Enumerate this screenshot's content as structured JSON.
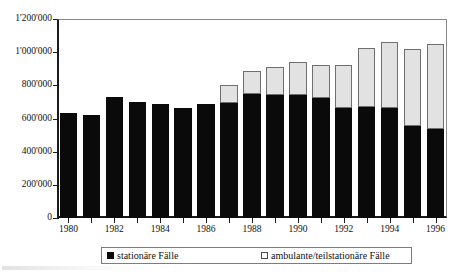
{
  "chart_data": {
    "type": "bar",
    "subtype": "stacked-vertical",
    "title": "",
    "xlabel": "",
    "ylabel": "",
    "ylim": [
      0,
      1200000
    ],
    "ytick_values": [
      0,
      200000,
      400000,
      600000,
      800000,
      1000000,
      1200000
    ],
    "ytick_labels": [
      "0",
      "200'000",
      "400'000",
      "600'000",
      "800'000",
      "1'000'000",
      "1'200'000"
    ],
    "grid": false,
    "legend_position": "bottom",
    "categories": [
      1980,
      1981,
      1982,
      1983,
      1984,
      1985,
      1986,
      1987,
      1988,
      1989,
      1990,
      1991,
      1992,
      1993,
      1994,
      1995,
      1996
    ],
    "xtick_labels_shown": [
      "1980",
      "1982",
      "1984",
      "1986",
      "1988",
      "1990",
      "1992",
      "1994",
      "1996"
    ],
    "series": [
      {
        "name": "stationäre Fälle",
        "color": "#0a0a0a",
        "values": [
          635000,
          620000,
          730000,
          700000,
          685000,
          665000,
          690000,
          695000,
          745000,
          740000,
          740000,
          725000,
          665000,
          670000,
          665000,
          555000,
          535000
        ]
      },
      {
        "name": "ambulante/teilstationäre Fälle",
        "color": "#e2e2e2",
        "values": [
          0,
          0,
          0,
          0,
          0,
          0,
          0,
          105000,
          140000,
          170000,
          200000,
          195000,
          260000,
          355000,
          395000,
          465000,
          515000
        ]
      }
    ],
    "totals": [
      635000,
      620000,
      730000,
      700000,
      685000,
      665000,
      690000,
      800000,
      885000,
      910000,
      940000,
      920000,
      925000,
      1025000,
      1060000,
      1020000,
      1050000
    ]
  },
  "axis": {
    "y_labels": [
      "1'200'000",
      "1'000'000",
      "800'000",
      "600'000",
      "400'000",
      "200'000",
      "0"
    ],
    "x_labels": [
      "1980",
      "1982",
      "1984",
      "1986",
      "1988",
      "1990",
      "1992",
      "1994",
      "1996"
    ]
  },
  "legend": {
    "items": [
      {
        "label": "stationäre Fälle",
        "swatch": "black-filled-square",
        "color": "#0a0a0a"
      },
      {
        "label": "ambulante/teilstationäre Fälle",
        "swatch": "white-outlined-square",
        "color": "#ffffff"
      }
    ]
  }
}
